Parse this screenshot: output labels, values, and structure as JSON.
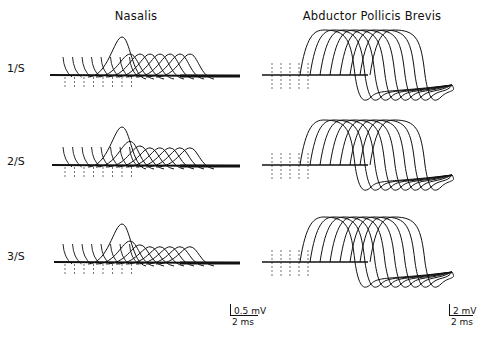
{
  "chart_data": {
    "type": "line",
    "title": "",
    "panels": [
      {
        "muscle": "Nasalis",
        "column": 0
      },
      {
        "muscle": "Abductor Pollicis Brevis",
        "column": 1
      }
    ],
    "rows": [
      {
        "label": "1/S",
        "stim_rate_hz": 1
      },
      {
        "label": "2/S",
        "stim_rate_hz": 2
      },
      {
        "label": "3/S",
        "stim_rate_hz": 3
      }
    ],
    "traces_per_panel": 8,
    "scale_bars": [
      {
        "panel": "Nasalis",
        "amplitude": "0.5 mV",
        "time": "2 ms"
      },
      {
        "panel": "Abductor Pollicis Brevis",
        "amplitude": "2 mV",
        "time": "2 ms"
      }
    ],
    "nasalis_peak_heights_relative": {
      "1/S": [
        0.55,
        0.55,
        0.55,
        0.55,
        0.55,
        0.55,
        0.55,
        1.0
      ],
      "2/S": [
        0.62,
        0.5,
        0.45,
        0.45,
        0.45,
        0.45,
        0.45,
        1.0
      ],
      "3/S": [
        0.55,
        0.45,
        0.4,
        0.4,
        0.4,
        0.4,
        0.4,
        1.0
      ]
    },
    "xlabel": "time",
    "ylabel": "amplitude",
    "grid": false,
    "legend": "none"
  },
  "labels": {
    "nasalis": "Nasalis",
    "apb": "Abductor Pollicis Brevis",
    "row1": "1/S",
    "row2": "2/S",
    "row3": "3/S",
    "scale_nasalis_v": "0.5 mV",
    "scale_nasalis_t": "2 ms",
    "scale_apb_v": "2 mV",
    "scale_apb_t": "2 ms"
  }
}
